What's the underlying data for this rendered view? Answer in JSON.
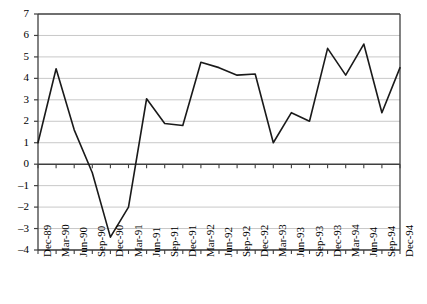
{
  "chart_data": {
    "type": "line",
    "title": "",
    "subtitle": "",
    "xlabel": "",
    "ylabel": "",
    "grid": true,
    "legend": false,
    "ylim": [
      -4,
      7
    ],
    "yticks": [
      7,
      6,
      5,
      4,
      3,
      2,
      1,
      0,
      -1,
      -2,
      -3,
      -4
    ],
    "ytick_labels": [
      "7",
      "6",
      "5",
      "4",
      "3",
      "2",
      "1",
      "0",
      "–1",
      "–2",
      "–3",
      "–4"
    ],
    "categories": [
      "Dec-89",
      "Mar-90",
      "Jun-90",
      "Sep-90",
      "Dec-90",
      "Mar-91",
      "Jun-91",
      "Sep-91",
      "Dec-91",
      "Mar-92",
      "Jun-92",
      "Sep-92",
      "Dec-92",
      "Mar-93",
      "Jun-93",
      "Sep-93",
      "Dec-93",
      "Mar-94",
      "Jun-94",
      "Sep-94",
      "Dec-94"
    ],
    "series": [
      {
        "name": "",
        "color": "#1a1a1a",
        "values": [
          1.0,
          4.45,
          1.6,
          -0.4,
          -3.4,
          -2.0,
          3.05,
          1.9,
          1.8,
          4.75,
          4.5,
          4.15,
          4.2,
          1.0,
          2.4,
          2.0,
          5.4,
          4.15,
          5.6,
          2.4,
          4.5
        ]
      }
    ],
    "axis_color": "#3f3f3f",
    "grid_color": "#c8c8c8",
    "line_width": 1.6
  }
}
